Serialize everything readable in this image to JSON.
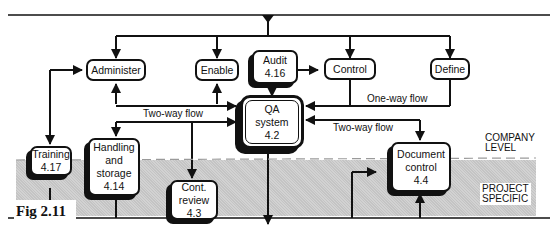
{
  "figure_label": "Fig 2.11",
  "zones": {
    "company": [
      "COMPANY",
      "LEVEL"
    ],
    "project": [
      "PROJECT",
      "SPECIFIC"
    ]
  },
  "flow_labels": {
    "two_way_left": "Two-way flow",
    "one_way": "One-way flow",
    "two_way_right": "Two-way flow"
  },
  "nodes": {
    "administer": {
      "lines": [
        "Administer"
      ]
    },
    "enable": {
      "lines": [
        "Enable"
      ]
    },
    "audit": {
      "lines": [
        "Audit",
        "4.16"
      ]
    },
    "control": {
      "lines": [
        "Control"
      ]
    },
    "define": {
      "lines": [
        "Define"
      ]
    },
    "qa_system": {
      "lines": [
        "QA",
        "system",
        "4.2"
      ]
    },
    "training": {
      "lines": [
        "Training",
        "4.17"
      ]
    },
    "handling": {
      "lines": [
        "Handling",
        "and",
        "storage",
        "4.14"
      ]
    },
    "cont_review": {
      "lines": [
        "Cont.",
        "review",
        "4.3"
      ]
    },
    "document_control": {
      "lines": [
        "Document",
        "control",
        "4.4"
      ]
    }
  },
  "colors": {
    "line": "#111111",
    "project_zone": "#c9c9c9",
    "dash": "#9a9a9a"
  }
}
